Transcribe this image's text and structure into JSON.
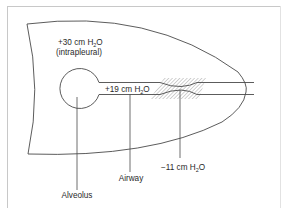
{
  "figure": {
    "type": "lung airway pressure schematic",
    "frame": {
      "border_color": "#c8c8c8"
    },
    "regions": {
      "intrapleural": {
        "pressure_sign": "+",
        "pressure_value": "30",
        "unit_prefix": "cm H",
        "unit_sub": "2",
        "unit_suffix": "O",
        "note": "(intrapleural)"
      },
      "airway_upstream": {
        "pressure_sign": "+",
        "pressure_value": "19",
        "unit_prefix": "cm H",
        "unit_sub": "2",
        "unit_suffix": "O"
      },
      "compression_point": {
        "pressure_sign": "−",
        "pressure_value": "11",
        "unit_prefix": "cm H",
        "unit_sub": "2",
        "unit_suffix": "O"
      }
    },
    "callouts": {
      "alveolus": "Alveolus",
      "airway": "Airway"
    },
    "colors": {
      "line": "#4a4a4a",
      "hatch": "#9a9a9a",
      "text": "#2a2a2a"
    }
  }
}
